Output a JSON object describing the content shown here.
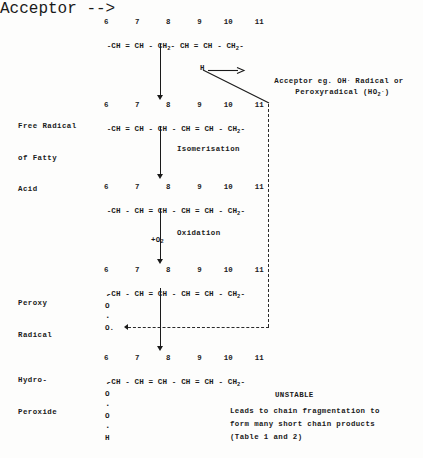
{
  "document": {
    "type": "lipid-peroxidation-scheme",
    "background_color": "#fdfdfc",
    "ink_color": "#1a1a1a"
  },
  "carbon_numbers": "6      7      8      9     10     11",
  "stages": [
    {
      "id": "fatty-acid",
      "label": "",
      "numbers": "6      7      8      9     10     11",
      "chain_prefix": "-CH = CH - CH",
      "chain_sub": "2",
      "chain_middle": "- CH = CH - CH",
      "chain_sub2": "2",
      "chain_suffix": "-"
    },
    {
      "id": "free-radical",
      "label_lines": [
        "Free Radical",
        "of Fatty",
        "Acid"
      ],
      "numbers": "6      7      8      9     10     11",
      "chain_prefix": "-CH = CH - CH - CH = CH - CH",
      "chain_sub": "2",
      "chain_suffix": "-"
    },
    {
      "id": "isomerised",
      "label_lines": [],
      "numbers": "6      7      8      9     10     11",
      "chain_prefix": "-CH - CH = CH - CH = CH - CH",
      "chain_sub": "2",
      "chain_suffix": "-"
    },
    {
      "id": "peroxy-radical",
      "label_lines": [
        "Peroxy",
        "Radical"
      ],
      "numbers": "6      7      8      9     10     11",
      "chain_prefix": "-CH - CH = CH - CH = CH - CH",
      "chain_sub": "2",
      "chain_suffix": "-",
      "atoms": [
        "O",
        "O."
      ]
    },
    {
      "id": "hydro-peroxide",
      "label_lines": [
        "Hydro-",
        "Peroxide"
      ],
      "numbers": "6      7      8      9     10     11",
      "chain_prefix": "-CH - CH = CH - CH = CH - CH",
      "chain_sub": "2",
      "chain_suffix": "-",
      "atoms": [
        "O",
        "O",
        "H"
      ]
    }
  ],
  "abstraction": {
    "hydrogen_label": "H",
    "acceptor_line1_a": "Acceptor eg. OH",
    "acceptor_line1_dot": ".",
    "acceptor_line1_b": " Radical or",
    "acceptor_line2_a": "Peroxyradical (HO",
    "acceptor_line2_sub": "2",
    "acceptor_line2_dot": ".",
    "acceptor_line2_b": ")"
  },
  "arrows": {
    "isomerisation_label": "Isomerisation",
    "oxidation_reagent_a": "+O",
    "oxidation_reagent_sub": "2",
    "oxidation_label": "Oxidation"
  },
  "footnote": {
    "heading": "UNSTABLE",
    "line1": "Leads to chain fragmentation to",
    "line2": "form many short chain products",
    "line3": "(Table 1 and 2)"
  }
}
